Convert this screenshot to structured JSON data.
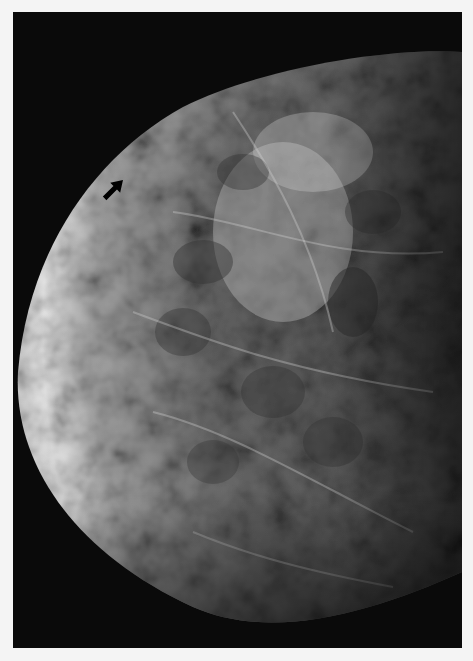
{
  "image": {
    "type": "mammogram",
    "description": "Grayscale breast X-ray showing dense fibroglandular tissue with a black arrow marker near the upper-left skin line",
    "annotation": {
      "marker": "arrow",
      "direction": "up-left",
      "color": "#000000"
    },
    "colors": {
      "background_border": "#f4f4f4",
      "film": "#0a0a0a",
      "skin_rim": "#e8e8e8",
      "tissue_mid": "#6e6e6e",
      "tissue_dark": "#3a3a3a"
    }
  }
}
